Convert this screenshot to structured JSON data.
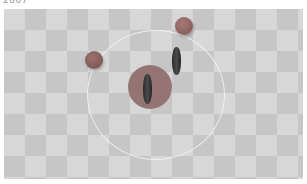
{
  "overlay": {
    "step_text": "2867"
  },
  "scene": {
    "floor": {
      "pattern": "checkerboard",
      "light": "#d7d7d7",
      "dark": "#c6c6c6",
      "tile_px": 21
    },
    "ring": {
      "cx": 151,
      "cy": 85,
      "rx": 68,
      "ry": 64,
      "color": "#f2f2f2"
    },
    "target_disc": {
      "cx": 146,
      "cy": 78,
      "r": 22,
      "color": "#8d6a68"
    },
    "balls": [
      {
        "name": "ball-top",
        "cx": 180,
        "cy": 17,
        "r": 9,
        "color": "#8f6360"
      },
      {
        "name": "ball-left",
        "cx": 90,
        "cy": 51,
        "r": 9,
        "color": "#86605d"
      }
    ],
    "agents": [
      {
        "name": "agent-center",
        "x": 139,
        "y": 65,
        "w": 9,
        "h": 30
      },
      {
        "name": "agent-right",
        "x": 168,
        "y": 38,
        "w": 9,
        "h": 28
      }
    ]
  }
}
